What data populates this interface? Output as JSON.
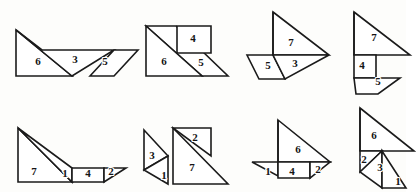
{
  "page": {
    "figure_count": 8,
    "stroke_color": "#1b1b1b",
    "fill_color": "#ffffff",
    "background_color": "#fdfdfb",
    "label_color": "#141414"
  },
  "figures": [
    {
      "id": "figure-1",
      "position": {
        "x": 12,
        "y": 24
      },
      "pieces": [
        {
          "label": "6",
          "label_x": 26,
          "label_y": 38,
          "points": "4,6 4,52 60,52"
        },
        {
          "label": "3",
          "label_x": 63,
          "label_y": 36,
          "points": "4,6 60,52 102,26 30,26"
        },
        {
          "label": "5",
          "label_x": 93,
          "label_y": 38,
          "points": "78,52 102,26 126,26 102,52"
        }
      ],
      "labels": [
        "6",
        "3",
        "5"
      ]
    },
    {
      "id": "figure-2",
      "position": {
        "x": 140,
        "y": 18
      },
      "pieces": [
        {
          "label": "6",
          "label_x": 24,
          "label_y": 44,
          "points": "6,8 6,58 62,58"
        },
        {
          "label": "4",
          "label_x": 53,
          "label_y": 21,
          "points": "37,8 71,8 71,35 37,35"
        },
        {
          "label": "5",
          "label_x": 61,
          "label_y": 45,
          "points": "6,8 62,58 88,58 36,8"
        }
      ],
      "labels": [
        "6",
        "4",
        "5"
      ]
    },
    {
      "id": "figure-3",
      "position": {
        "x": 243,
        "y": 8
      },
      "pieces": [
        {
          "label": "7",
          "label_x": 48,
          "label_y": 35,
          "points": "30,4 86,47 30,47"
        },
        {
          "label": "5",
          "label_x": 25,
          "label_y": 58,
          "points": "4,47 30,47 42,71 16,71"
        },
        {
          "label": "3",
          "label_x": 52,
          "label_y": 56,
          "points": "30,47 86,47 42,71"
        }
      ],
      "labels": [
        "7",
        "5",
        "3"
      ]
    },
    {
      "id": "figure-4",
      "position": {
        "x": 346,
        "y": 8
      },
      "pieces": [
        {
          "label": "7",
          "label_x": 28,
          "label_y": 30,
          "points": "8,4 64,47 8,47"
        },
        {
          "label": "4",
          "label_x": 16,
          "label_y": 58,
          "points": "8,47 30,47 30,70 8,70"
        },
        {
          "label": "5",
          "label_x": 32,
          "label_y": 74,
          "points": "8,70 30,70 54,70 32,86 10,86"
        }
      ],
      "labels": [
        "7",
        "4",
        "5"
      ]
    },
    {
      "id": "figure-5",
      "position": {
        "x": 12,
        "y": 120
      },
      "pieces": [
        {
          "label": "7",
          "label_x": 22,
          "label_y": 52,
          "points": "6,8 6,62 60,62"
        },
        {
          "label": "1",
          "label_x": 53,
          "label_y": 54,
          "points": "6,8 60,62 60,48"
        },
        {
          "label": "4",
          "label_x": 76,
          "label_y": 54,
          "points": "60,48 92,48 92,62 60,62"
        },
        {
          "label": "2",
          "label_x": 99,
          "label_y": 52,
          "points": "92,48 114,48 92,62"
        }
      ],
      "labels": [
        "7",
        "1",
        "4",
        "2"
      ]
    },
    {
      "id": "figure-6",
      "position": {
        "x": 132,
        "y": 112
      },
      "pieces": [
        {
          "label": "3",
          "label_x": 20,
          "label_y": 44,
          "points": "12,18 12,58 36,44"
        },
        {
          "label": "1",
          "label_x": 32,
          "label_y": 64,
          "points": "12,58 36,44 36,72"
        },
        {
          "label": "2",
          "label_x": 63,
          "label_y": 26,
          "points": "41,16 79,16 79,44"
        },
        {
          "label": "7",
          "label_x": 60,
          "label_y": 56,
          "points": "41,16 96,72 41,72"
        }
      ],
      "labels": [
        "3",
        "1",
        "2",
        "7"
      ]
    },
    {
      "id": "figure-7",
      "position": {
        "x": 244,
        "y": 112
      },
      "pieces": [
        {
          "label": "6",
          "label_x": 54,
          "label_y": 38,
          "points": "34,8 86,50 34,50"
        },
        {
          "label": "1",
          "label_x": 24,
          "label_y": 60,
          "points": "8,50 34,50 34,64"
        },
        {
          "label": "4",
          "label_x": 48,
          "label_y": 60,
          "points": "34,50 66,50 66,66 34,66"
        },
        {
          "label": "2",
          "label_x": 74,
          "label_y": 58,
          "points": "66,50 86,50 66,66"
        }
      ],
      "labels": [
        "6",
        "1",
        "4",
        "2"
      ]
    },
    {
      "id": "figure-8",
      "position": {
        "x": 344,
        "y": 104
      },
      "pieces": [
        {
          "label": "6",
          "label_x": 30,
          "label_y": 32,
          "points": "16,4 70,47 16,47"
        },
        {
          "label": "2",
          "label_x": 20,
          "label_y": 56,
          "points": "16,47 38,47 16,68"
        },
        {
          "label": "3",
          "label_x": 36,
          "label_y": 64,
          "points": "16,68 38,47 38,84"
        },
        {
          "label": "1",
          "label_x": 54,
          "label_y": 78,
          "points": "38,47 62,84 38,84"
        }
      ],
      "labels": [
        "6",
        "2",
        "3",
        "1"
      ]
    }
  ]
}
